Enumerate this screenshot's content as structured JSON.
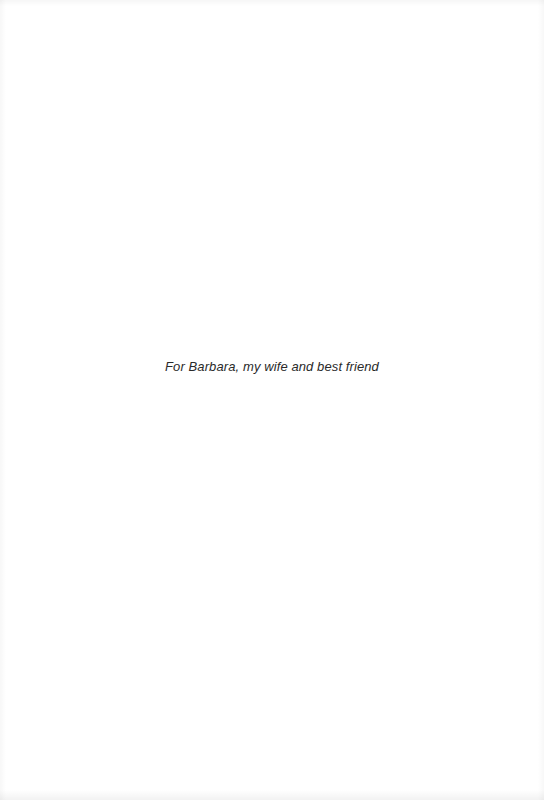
{
  "page": {
    "background": "#ffffff",
    "dedication": "For Barbara, my wife and best friend"
  }
}
